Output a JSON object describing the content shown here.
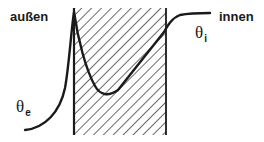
{
  "diagram": {
    "type": "temperature-profile-through-wall",
    "labels": {
      "outside": "außen",
      "inside": "innen"
    },
    "symbols": {
      "theta_inside": {
        "base": "θ",
        "sub": "i"
      },
      "theta_exterior": {
        "base": "θ",
        "sub": "e"
      }
    },
    "colors": {
      "line": "#1a1a1a",
      "hatch": "#2a2a2a",
      "background": "#ffffff"
    },
    "wall": {
      "x_left": 73,
      "x_right": 166,
      "y_top": 8,
      "y_bottom": 135,
      "hatch": "diagonal-45deg"
    },
    "curve": {
      "description": "temperature rises from exterior, peaks at outer wall face, dips inside wall, then rises to interior plateau",
      "points": [
        [
          25,
          130
        ],
        [
          50,
          118
        ],
        [
          64,
          90
        ],
        [
          71,
          45
        ],
        [
          74,
          12
        ],
        [
          82,
          50
        ],
        [
          92,
          82
        ],
        [
          103,
          95
        ],
        [
          120,
          85
        ],
        [
          166,
          30
        ],
        [
          175,
          17
        ],
        [
          190,
          14
        ],
        [
          210,
          14
        ]
      ]
    }
  }
}
